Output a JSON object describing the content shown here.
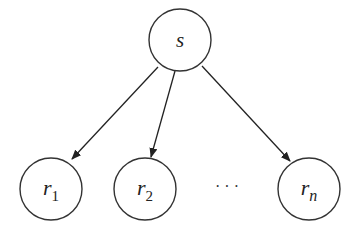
{
  "diagram": {
    "type": "tree",
    "root": {
      "id": "s",
      "label": "s",
      "cx": 180,
      "cy": 40,
      "r": 31
    },
    "children": [
      {
        "id": "r1",
        "label": "r",
        "subscript": "1",
        "cx": 51,
        "cy": 189,
        "r": 31
      },
      {
        "id": "r2",
        "label": "r",
        "subscript": "2",
        "cx": 145,
        "cy": 189,
        "r": 31
      },
      {
        "id": "rn",
        "label": "r",
        "subscript": "n",
        "cx": 309,
        "cy": 189,
        "r": 31
      }
    ],
    "ellipsis": "· · ·",
    "edges": [
      {
        "from": "s",
        "to": "r1",
        "directed": true
      },
      {
        "from": "s",
        "to": "r2",
        "directed": true
      },
      {
        "from": "s",
        "to": "rn",
        "directed": true
      }
    ],
    "colors": {
      "stroke": "#333333",
      "background": "#ffffff"
    }
  }
}
